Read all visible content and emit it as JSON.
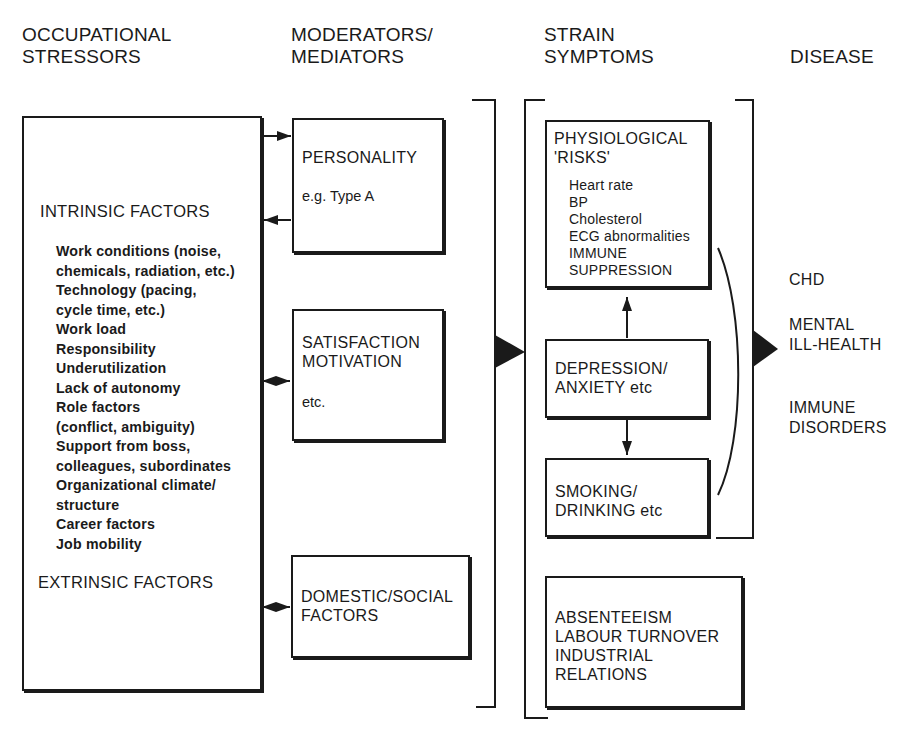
{
  "columns": {
    "stressors": "OCCUPATIONAL\nSTRESSORS",
    "moderators": "MODERATORS/\nMEDIATORS",
    "strain": "STRAIN\nSYMPTOMS",
    "disease": "DISEASE"
  },
  "stressors_box": {
    "intrinsic_heading": "INTRINSIC FACTORS",
    "items": [
      "Work conditions (noise,",
      "chemicals, radiation, etc.)",
      "Technology (pacing,",
      "cycle time, etc.)",
      "Work load",
      "Responsibility",
      "Underutilization",
      "Lack of autonomy",
      "Role factors",
      "(conflict, ambiguity)",
      "Support from boss,",
      "colleagues, subordinates",
      "Organizational climate/",
      "structure",
      "Career factors",
      "Job mobility"
    ],
    "extrinsic_heading": "EXTRINSIC FACTORS"
  },
  "moderators_boxes": {
    "personality": {
      "title": "PERSONALITY",
      "detail": "e.g. Type A"
    },
    "satisfaction": {
      "title": "SATISFACTION\nMOTIVATION",
      "detail": "etc."
    },
    "domestic": {
      "title": "DOMESTIC/SOCIAL\nFACTORS"
    }
  },
  "strain_boxes": {
    "physiological": {
      "title": "PHYSIOLOGICAL\n'RISKS'",
      "items": [
        "Heart rate",
        "BP",
        "Cholesterol",
        "ECG abnormalities",
        "IMMUNE",
        "SUPPRESSION"
      ]
    },
    "depression": {
      "title": "DEPRESSION/\nANXIETY etc"
    },
    "smoking": {
      "title": "SMOKING/\nDRINKING etc"
    },
    "absenteeism": {
      "title": "ABSENTEEISM\nLABOUR TURNOVER\nINDUSTRIAL\n        RELATIONS"
    }
  },
  "disease_outcomes": {
    "chd": "CHD",
    "mental": "MENTAL\nILL-HEALTH",
    "immune": "IMMUNE\nDISORDERS"
  }
}
